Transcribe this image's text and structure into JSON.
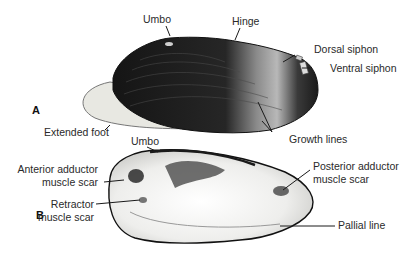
{
  "figure": {
    "panels": [
      {
        "id": "A",
        "label": "A",
        "view": "external shell with extended foot"
      },
      {
        "id": "B",
        "label": "B",
        "view": "interior of valve"
      }
    ],
    "labels_a": {
      "umbo": "Umbo",
      "hinge": "Hinge",
      "dorsal_siphon": "Dorsal siphon",
      "ventral_siphon": "Ventral siphon",
      "extended_foot": "Extended foot",
      "growth_lines": "Growth lines"
    },
    "labels_b": {
      "umbo": "Umbo",
      "anterior_adductor_1": "Anterior adductor",
      "anterior_adductor_2": "muscle scar",
      "retractor_1": "Retractor",
      "retractor_2": "muscle scar",
      "posterior_adductor_1": "Posterior adductor",
      "posterior_adductor_2": "muscle scar",
      "pallial_line": "Pallial line"
    },
    "colors": {
      "shell_dark": "#1e1e1e",
      "shell_light": "#9a9a9a",
      "foot": "#e6e6e0",
      "interior": "#f2f2f0",
      "leader": "#1a1a1a"
    }
  }
}
